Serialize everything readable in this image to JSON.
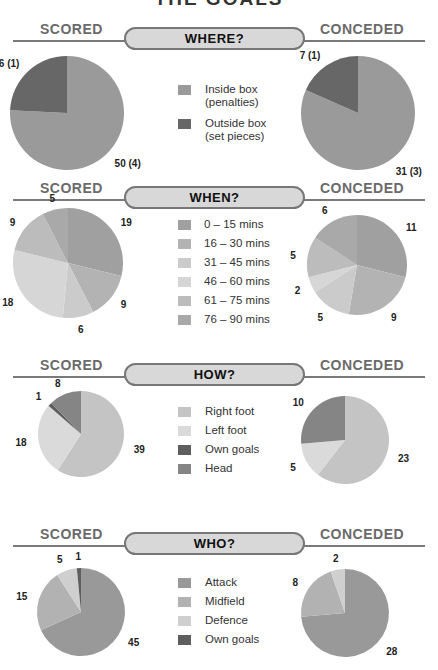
{
  "page": {
    "title": "THE GOALS"
  },
  "labels": {
    "scored": "SCORED",
    "conceded": "CONCEDED"
  },
  "colors": {
    "line": "#7a7a7a",
    "pill_bg": "#d8d8d8",
    "side_text": "#6a6a6a"
  },
  "sections": [
    {
      "id": "where",
      "title": "WHERE?",
      "legend": [
        {
          "label": "Inside box",
          "sub": "(penalties)",
          "color": "#9a9a9a"
        },
        {
          "label": "Outside box",
          "sub": "(set pieces)",
          "color": "#676767"
        }
      ]
    },
    {
      "id": "when",
      "title": "WHEN?",
      "legend": [
        {
          "label": "0 – 15 mins",
          "color": "#a0a0a0"
        },
        {
          "label": "16 – 30 mins",
          "color": "#b3b3b3"
        },
        {
          "label": "31 – 45 mins",
          "color": "#cbcbcb"
        },
        {
          "label": "46 – 60 mins",
          "color": "#d6d6d6"
        },
        {
          "label": "61 – 75 mins",
          "color": "#bcbcbc"
        },
        {
          "label": "76 – 90 mins",
          "color": "#a9a9a9"
        }
      ]
    },
    {
      "id": "how",
      "title": "HOW?",
      "legend": [
        {
          "label": "Right foot",
          "color": "#c4c4c4"
        },
        {
          "label": "Left foot",
          "color": "#dadada"
        },
        {
          "label": "Own goals",
          "color": "#5e5e5e"
        },
        {
          "label": "Head",
          "color": "#858585"
        }
      ]
    },
    {
      "id": "who",
      "title": "WHO?",
      "legend": [
        {
          "label": "Attack",
          "color": "#999999"
        },
        {
          "label": "Midfield",
          "color": "#b2b2b2"
        },
        {
          "label": "Defence",
          "color": "#cfcfcf"
        },
        {
          "label": "Own goals",
          "color": "#5e5e5e"
        }
      ]
    }
  ],
  "chart_data": [
    {
      "type": "pie",
      "title": "WHERE? – Scored",
      "categories": [
        "Inside box (penalties)",
        "Outside box (set pieces)"
      ],
      "values": [
        50,
        16
      ],
      "data_labels": [
        "50 (4)",
        "16 (1)"
      ]
    },
    {
      "type": "pie",
      "title": "WHERE? – Conceded",
      "categories": [
        "Inside box (penalties)",
        "Outside box (set pieces)"
      ],
      "values": [
        31,
        7
      ],
      "data_labels": [
        "31 (3)",
        "7 (1)"
      ]
    },
    {
      "type": "pie",
      "title": "WHEN? – Scored",
      "categories": [
        "0 – 15 mins",
        "16 – 30 mins",
        "31 – 45 mins",
        "46 – 60 mins",
        "61 – 75 mins",
        "76 – 90 mins"
      ],
      "values": [
        19,
        9,
        6,
        18,
        9,
        5
      ],
      "data_labels": [
        "19",
        "9",
        "6",
        "18",
        "9",
        "5"
      ]
    },
    {
      "type": "pie",
      "title": "WHEN? – Conceded",
      "categories": [
        "0 – 15 mins",
        "16 – 30 mins",
        "31 – 45 mins",
        "46 – 60 mins",
        "61 – 75 mins",
        "76 – 90 mins"
      ],
      "values": [
        11,
        9,
        5,
        2,
        5,
        6
      ],
      "data_labels": [
        "11",
        "9",
        "5",
        "2",
        "5",
        "6"
      ]
    },
    {
      "type": "pie",
      "title": "HOW? – Scored",
      "categories": [
        "Right foot",
        "Left foot",
        "Own goals",
        "Head"
      ],
      "values": [
        39,
        18,
        1,
        8
      ],
      "data_labels": [
        "39",
        "18",
        "1",
        "8"
      ]
    },
    {
      "type": "pie",
      "title": "HOW? – Conceded",
      "categories": [
        "Right foot",
        "Left foot",
        "Own goals",
        "Head"
      ],
      "values": [
        23,
        5,
        0,
        10
      ],
      "data_labels": [
        "23",
        "5",
        "",
        "10"
      ]
    },
    {
      "type": "pie",
      "title": "WHO? – Scored",
      "categories": [
        "Attack",
        "Midfield",
        "Defence",
        "Own goals"
      ],
      "values": [
        45,
        15,
        5,
        1
      ],
      "data_labels": [
        "45",
        "15",
        "5",
        "1"
      ]
    },
    {
      "type": "pie",
      "title": "WHO? – Conceded",
      "categories": [
        "Attack",
        "Midfield",
        "Defence",
        "Own goals"
      ],
      "values": [
        28,
        8,
        2,
        0
      ],
      "data_labels": [
        "28",
        "8",
        "2",
        ""
      ]
    }
  ]
}
